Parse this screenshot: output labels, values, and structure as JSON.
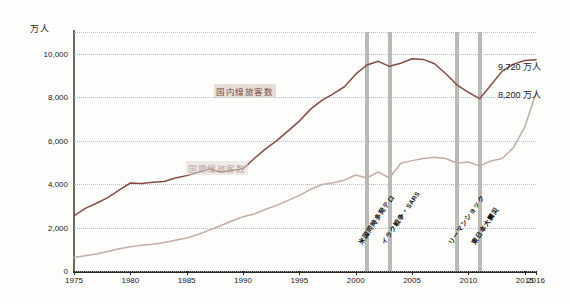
{
  "chart_data": {
    "type": "line",
    "title": "",
    "xlabel": "",
    "ylabel": "",
    "unit_label": "万人",
    "xlim": [
      1975,
      2016
    ],
    "ylim": [
      0,
      11000
    ],
    "grid": true,
    "legend": "inline",
    "y_ticks": [
      "0",
      "2,000",
      "4,000",
      "6,000",
      "8,000",
      "10,000"
    ],
    "y_tick_values": [
      0,
      2000,
      4000,
      6000,
      8000,
      10000
    ],
    "x_ticks": [
      "1975",
      "1980",
      "1985",
      "1990",
      "1995",
      "2000",
      "2005",
      "2010",
      "2015",
      "2016"
    ],
    "x_tick_values": [
      1975,
      1980,
      1985,
      1990,
      1995,
      2000,
      2005,
      2010,
      2015,
      2016
    ],
    "x": [
      1975,
      1976,
      1977,
      1978,
      1979,
      1980,
      1981,
      1982,
      1983,
      1984,
      1985,
      1986,
      1987,
      1988,
      1989,
      1990,
      1991,
      1992,
      1993,
      1994,
      1995,
      1996,
      1997,
      1998,
      1999,
      2000,
      2001,
      2002,
      2003,
      2004,
      2005,
      2006,
      2007,
      2008,
      2009,
      2010,
      2011,
      2012,
      2013,
      2014,
      2015,
      2016
    ],
    "series": [
      {
        "name": "国内線旅客数",
        "color": "#8a4a42",
        "end_label": "9,720 万人",
        "end_value": 9720,
        "values": [
          2540,
          2880,
          3120,
          3380,
          3720,
          4050,
          4030,
          4080,
          4120,
          4280,
          4390,
          4540,
          4700,
          4560,
          4620,
          4700,
          5180,
          5620,
          6000,
          6450,
          6900,
          7450,
          7850,
          8150,
          8480,
          9060,
          9480,
          9650,
          9420,
          9560,
          9770,
          9740,
          9540,
          9080,
          8560,
          8220,
          7930,
          8560,
          9200,
          9520,
          9690,
          9720
        ]
      },
      {
        "name": "国際線旅客数",
        "color": "#c3ada4",
        "end_label": "8,200 万人",
        "end_value": 8200,
        "values": [
          620,
          700,
          780,
          900,
          1020,
          1120,
          1180,
          1230,
          1310,
          1420,
          1520,
          1680,
          1880,
          2080,
          2300,
          2500,
          2620,
          2840,
          3020,
          3250,
          3480,
          3760,
          3980,
          4060,
          4180,
          4420,
          4280,
          4560,
          4280,
          4960,
          5080,
          5180,
          5240,
          5180,
          4960,
          5020,
          4840,
          5060,
          5180,
          5680,
          6620,
          8200
        ]
      }
    ],
    "events": [
      {
        "year": 2001,
        "label": "米国同時多発テロ"
      },
      {
        "year": 2003,
        "label": "イラク戦争・SARS"
      },
      {
        "year": 2009,
        "label": "リーマンショック"
      },
      {
        "year": 2011,
        "label": "東日本大震災"
      }
    ],
    "colors": {
      "domestic": "#8a4a42",
      "international": "#c3ada4",
      "grid": "#9fb6c9",
      "axis": "#2a2a2a",
      "event_band": "#b9b9b6",
      "background": "#fdfdfc"
    }
  }
}
